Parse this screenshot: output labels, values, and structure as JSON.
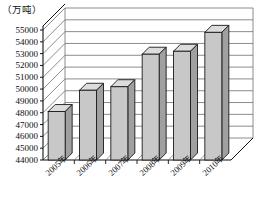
{
  "chart_data": {
    "type": "bar",
    "title": "",
    "subtitle": "",
    "unit_label": "（万吨）",
    "xlabel": "",
    "ylabel": "",
    "categories": [
      "2005年",
      "2006年",
      "2007年",
      "2008年",
      "2009年",
      "2010年"
    ],
    "values": [
      48100,
      49900,
      50200,
      52950,
      53200,
      54800
    ],
    "series": [
      {
        "name": "产量",
        "values": [
          48100,
          49900,
          50200,
          52950,
          53200,
          54800
        ]
      }
    ],
    "ylim": [
      44000,
      55000
    ],
    "ytick_step": 1000,
    "ytick_labels": [
      "44000",
      "45000",
      "46000",
      "47000",
      "48000",
      "49000",
      "50000",
      "51000",
      "52000",
      "53000",
      "54000",
      "55000"
    ],
    "ytick_values": [
      44000,
      45000,
      46000,
      47000,
      48000,
      49000,
      50000,
      51000,
      52000,
      53000,
      54000,
      55000
    ],
    "grid": true,
    "legend": false,
    "legend_position": "none",
    "style": "3d-column",
    "colors": {
      "bar_front": "#c8c8c8",
      "bar_side": "#a0a0a0",
      "bar_top": "#dcdcdc",
      "bar_outline": "#1a1a1a",
      "grid": "#6e6e6e",
      "axis": "#111111",
      "background": "#ffffff",
      "wall": "#ffffff",
      "floor": "#ffffff"
    }
  }
}
